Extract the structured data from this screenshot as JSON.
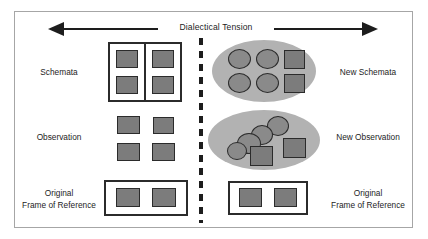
{
  "diagram": {
    "title": "Dialectical Tension",
    "arrow": {
      "name": "double-headed-arrow",
      "direction": "bidirectional",
      "color": "#1d1d1d"
    },
    "divider": {
      "name": "vertical-dashed-divider",
      "style": "dashed",
      "color": "#1d1d1d"
    },
    "colors": {
      "shape_fill": "#7c7c7c",
      "circle_fill": "#8a8a8a",
      "ellipse_fill": "#b2b2b2",
      "outline": "#2b2b2b",
      "frame_border": "#a6a6a6",
      "background": "#ffffff",
      "text": "#1d1d1d"
    },
    "left_labels": [
      {
        "id": "schemata",
        "text": "Schemata"
      },
      {
        "id": "observation",
        "text": "Observation"
      },
      {
        "id": "frame",
        "line1": "Original",
        "line2": "Frame of Reference"
      }
    ],
    "right_labels": [
      {
        "id": "new-schemata",
        "text": "New Schemata"
      },
      {
        "id": "new-observation",
        "text": "New Observation"
      },
      {
        "id": "frame",
        "line1": "Original",
        "line2": "Frame of Reference"
      }
    ],
    "left_side": {
      "schemata_group": {
        "name": "schemata-container",
        "shape": "thick-rectangle-split-in-two",
        "square_count": 4,
        "layout": "2x2"
      },
      "observation_group": {
        "name": "observation-squares",
        "shape": "free-floating-squares",
        "square_count": 4,
        "layout": "2x2"
      },
      "frame_group": {
        "name": "original-frame-of-reference",
        "shape": "thick-rectangle",
        "square_count": 2,
        "layout": "1x2"
      }
    },
    "right_side": {
      "new_schemata_group": {
        "name": "new-schemata-ellipse",
        "shape": "ellipse",
        "circle_count": 4,
        "square_count": 2,
        "layout": "ordered"
      },
      "new_observation_group": {
        "name": "new-observation-ellipse",
        "shape": "ellipse",
        "circle_count": 4,
        "square_count": 2,
        "layout": "overlapping-cluster"
      },
      "frame_group": {
        "name": "original-frame-of-reference",
        "shape": "rectangle",
        "square_count": 2,
        "layout": "1x2"
      }
    }
  }
}
